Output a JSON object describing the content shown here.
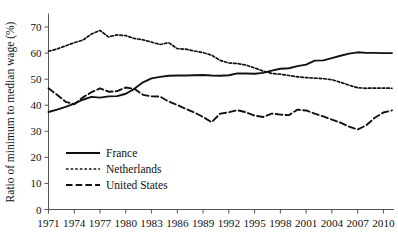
{
  "chart_data": {
    "type": "line",
    "title": "",
    "xlabel": "",
    "ylabel": "Ratio of minimum to median wage (%)",
    "ylim": [
      0,
      75
    ],
    "xlim": [
      1971,
      2011
    ],
    "grid": false,
    "legend_position": "bottom-left",
    "y_ticks": [
      "0",
      "10",
      "20",
      "30",
      "40",
      "50",
      "60",
      "70"
    ],
    "y_tick_values": [
      0,
      10,
      20,
      30,
      40,
      50,
      60,
      70
    ],
    "x_ticks": [
      "1971",
      "1974",
      "1977",
      "1980",
      "1983",
      "1986",
      "1989",
      "1992",
      "1995",
      "1998",
      "2001",
      "2004",
      "2007",
      "2010"
    ],
    "x_tick_values": [
      1971,
      1974,
      1977,
      1980,
      1983,
      1986,
      1989,
      1992,
      1995,
      1998,
      2001,
      2004,
      2007,
      2010
    ],
    "x": [
      1971,
      1972,
      1973,
      1974,
      1975,
      1976,
      1977,
      1978,
      1979,
      1980,
      1981,
      1982,
      1983,
      1984,
      1985,
      1986,
      1987,
      1988,
      1989,
      1990,
      1991,
      1992,
      1993,
      1994,
      1995,
      1996,
      1997,
      1998,
      1999,
      2000,
      2001,
      2002,
      2003,
      2004,
      2005,
      2006,
      2007,
      2008,
      2009,
      2010,
      2011
    ],
    "series": [
      {
        "name": "France",
        "style": "solid",
        "color": "#111111",
        "values": [
          37.4,
          38.3,
          39.4,
          40.6,
          42.1,
          43.2,
          42.9,
          43.4,
          43.5,
          44.4,
          46.3,
          48.8,
          50.3,
          50.9,
          51.3,
          51.4,
          51.4,
          51.5,
          51.6,
          51.4,
          51.3,
          51.5,
          52.2,
          52.2,
          52.1,
          52.4,
          53.3,
          54.0,
          54.2,
          55.0,
          55.6,
          57.1,
          57.2,
          58.1,
          59.0,
          59.8,
          60.3,
          60.1,
          60.1,
          60.0,
          60.0
        ]
      },
      {
        "name": "Netherlands",
        "style": "dotted",
        "color": "#111111",
        "values": [
          60.7,
          61.6,
          62.8,
          64.0,
          65.0,
          67.3,
          68.7,
          66.2,
          67.0,
          66.7,
          65.6,
          65.1,
          64.2,
          63.3,
          64.0,
          61.7,
          61.5,
          60.8,
          60.2,
          59.2,
          57.2,
          56.2,
          56.0,
          55.4,
          54.3,
          53.1,
          52.2,
          51.9,
          51.4,
          50.9,
          50.6,
          50.4,
          50.2,
          49.8,
          48.8,
          47.7,
          46.7,
          46.5,
          46.6,
          46.6,
          46.5
        ]
      },
      {
        "name": "United States",
        "style": "dashed",
        "color": "#111111",
        "values": [
          46.5,
          44.0,
          41.3,
          40.4,
          43.0,
          45.0,
          46.5,
          45.2,
          45.4,
          46.8,
          46.3,
          44.0,
          43.4,
          43.3,
          41.4,
          40.1,
          38.6,
          37.2,
          35.5,
          33.5,
          36.8,
          37.3,
          38.1,
          37.3,
          36.0,
          35.5,
          36.8,
          36.4,
          36.2,
          38.3,
          38.0,
          36.8,
          35.7,
          34.5,
          33.3,
          31.8,
          30.7,
          32.3,
          35.2,
          37.2,
          38.0
        ]
      }
    ]
  },
  "legend": {
    "items": [
      {
        "label": "France",
        "style": "solid"
      },
      {
        "label": "Netherlands",
        "style": "dotted"
      },
      {
        "label": "United States",
        "style": "dashed"
      }
    ]
  }
}
